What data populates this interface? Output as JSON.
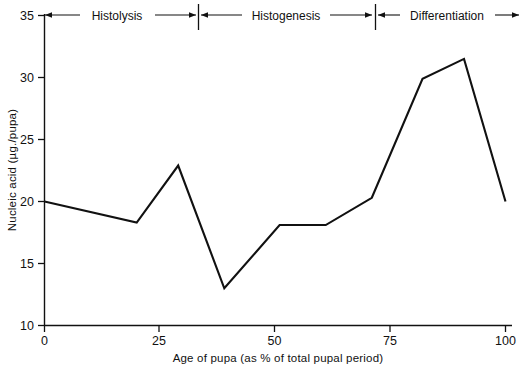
{
  "chart_data": {
    "type": "line",
    "title": "",
    "xlabel": "Age of pupa (as % of total pupal period)",
    "ylabel": "Nucleic acid (µg./pupa)",
    "xlim": [
      0,
      100
    ],
    "ylim": [
      10,
      35
    ],
    "xticks": [
      0,
      25,
      50,
      75,
      100
    ],
    "yticks": [
      10,
      15,
      20,
      25,
      30,
      35
    ],
    "xtick_labels": [
      "0",
      "25",
      "50",
      "75",
      "100"
    ],
    "ytick_labels": [
      "10",
      "15",
      "20",
      "25",
      "30",
      "35"
    ],
    "grid": false,
    "legend": "none",
    "line_color": "#111111",
    "series": [
      {
        "name": "Nucleic acid",
        "x": [
          0,
          20,
          29,
          39,
          51,
          61,
          71,
          82,
          91,
          100
        ],
        "values": [
          20.0,
          18.3,
          22.9,
          13.0,
          18.1,
          18.1,
          20.3,
          29.9,
          31.5,
          20.0
        ]
      }
    ],
    "annotations": [
      {
        "label": "Histolysis",
        "x_start": 0,
        "x_end": 33
      },
      {
        "label": "Histogenesis",
        "x_start": 33,
        "x_end": 72
      },
      {
        "label": "Differentiation",
        "x_start": 72,
        "x_end": 100
      }
    ],
    "phase_divider_x": [
      33,
      72
    ]
  },
  "axes": {
    "x_title": "Age of pupa (as % of total pupal period)",
    "y_title": "Nucleic acid (µg./pupa)"
  },
  "phases": {
    "histolysis": "Histolysis",
    "histogenesis": "Histogenesis",
    "differentiation": "Differentiation"
  },
  "yticks": {
    "t0": "10",
    "t1": "15",
    "t2": "20",
    "t3": "25",
    "t4": "30",
    "t5": "35"
  },
  "xticks": {
    "t0": "0",
    "t1": "25",
    "t2": "50",
    "t3": "75",
    "t4": "100"
  }
}
